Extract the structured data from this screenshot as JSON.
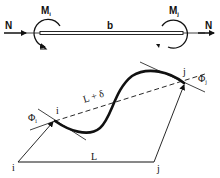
{
  "diagram": {
    "top_element": {
      "axial_force_left": "N",
      "axial_force_right": "N",
      "moment_left": {
        "symbol": "M",
        "subscript": "i"
      },
      "moment_right": {
        "symbol": "M",
        "subscript": "j"
      },
      "length_label": "b"
    },
    "bottom_element": {
      "node_i_deformed": "i",
      "node_j_deformed": "j",
      "node_i_original": "i",
      "node_j_original": "j",
      "chord_label": "L + δ",
      "original_length_label": "L",
      "rotation_i": {
        "symbol": "Φ",
        "subscript": "i"
      },
      "rotation_j": {
        "symbol": "Φ",
        "subscript": "j"
      }
    },
    "colors": {
      "ink": "#111111",
      "background": "#ffffff"
    }
  }
}
